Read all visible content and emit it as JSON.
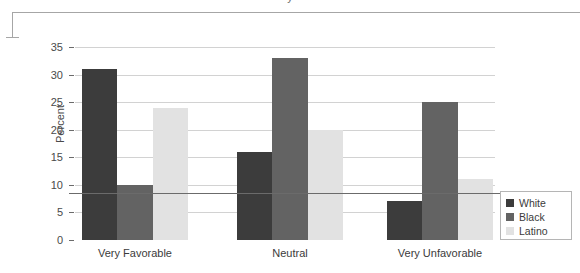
{
  "title_fragment": "y",
  "chart_data": {
    "type": "bar",
    "title": "",
    "xlabel": "",
    "ylabel": "Percent",
    "ylim": [
      0,
      35
    ],
    "ytick_values": [
      0,
      5,
      10,
      15,
      20,
      25,
      30,
      35
    ],
    "ytick_labels": [
      "0",
      "5",
      "10",
      "15",
      "20",
      "25",
      "30",
      "35"
    ],
    "grid": true,
    "legend_position": "right",
    "categories": [
      "Very Favorable",
      "Neutral",
      "Very Unfavorable"
    ],
    "series": [
      {
        "name": "White",
        "color": "#3c3c3c",
        "values": [
          31,
          16,
          7
        ]
      },
      {
        "name": "Black",
        "color": "#636363",
        "values": [
          10,
          33,
          25
        ]
      },
      {
        "name": "Latino",
        "color": "#e2e2e2",
        "values": [
          24,
          20,
          11
        ]
      }
    ]
  }
}
